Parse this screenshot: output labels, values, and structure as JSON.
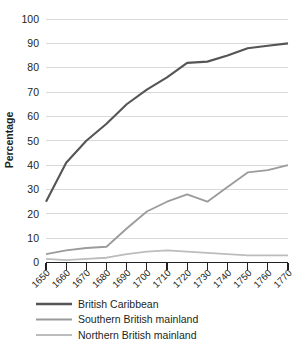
{
  "chart_data": {
    "type": "line",
    "title": "",
    "xlabel": "",
    "ylabel": "Percentage",
    "x": [
      1650,
      1660,
      1670,
      1680,
      1690,
      1700,
      1710,
      1720,
      1730,
      1740,
      1750,
      1760,
      1770
    ],
    "xtick_labels": [
      "1650",
      "1660",
      "1670",
      "1680",
      "1690",
      "1700",
      "1710",
      "1720",
      "1730",
      "1740",
      "1750",
      "1760",
      "1770"
    ],
    "ytick_labels": [
      "0",
      "10",
      "20",
      "30",
      "40",
      "50",
      "60",
      "70",
      "80",
      "90",
      "100"
    ],
    "yticks": [
      0,
      10,
      20,
      30,
      40,
      50,
      60,
      70,
      80,
      90,
      100
    ],
    "ylim": [
      0,
      100
    ],
    "xlim": [
      1650,
      1770
    ],
    "grid": "horizontal",
    "legend_position": "below",
    "series": [
      {
        "name": "British Caribbean",
        "color": "#555555",
        "values": [
          25,
          41,
          50,
          57,
          65,
          71,
          76,
          82,
          82.5,
          85,
          88,
          89,
          90
        ]
      },
      {
        "name": "Southern British mainland",
        "color": "#9b9b9b",
        "values": [
          3.5,
          5,
          6,
          6.5,
          14,
          21,
          25,
          28,
          25,
          31,
          37,
          38,
          40
        ]
      },
      {
        "name": "Northern British mainland",
        "color": "#bcbcbc",
        "values": [
          1.5,
          1,
          1.5,
          2,
          3.5,
          4.5,
          5,
          4.5,
          4,
          3.5,
          3,
          3,
          3
        ]
      }
    ]
  },
  "axes": {
    "y_title": "Percentage"
  },
  "legend": {
    "items": [
      {
        "label": "British Caribbean",
        "color": "#555555"
      },
      {
        "label": "Southern British mainland",
        "color": "#9b9b9b"
      },
      {
        "label": "Northern British mainland",
        "color": "#bcbcbc"
      }
    ]
  }
}
